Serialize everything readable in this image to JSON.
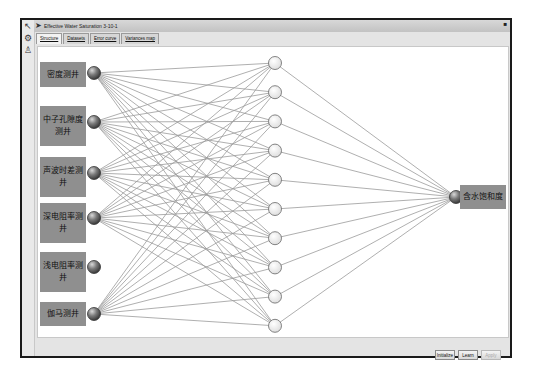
{
  "window": {
    "title": "Effective Water Saturation 3-10-1",
    "close_glyph": "■"
  },
  "sidebar_icons": [
    {
      "name": "pointer-icon",
      "glyph": "↖"
    },
    {
      "name": "gear-icon",
      "glyph": "⚙"
    },
    {
      "name": "person-icon",
      "glyph": "♙"
    }
  ],
  "tabs": [
    {
      "label": "Structure",
      "active": true
    },
    {
      "label": "Datasets",
      "active": false
    },
    {
      "label": "Error curve",
      "active": false
    },
    {
      "label": "Variances map",
      "active": false
    }
  ],
  "network": {
    "input_layer": [
      {
        "label": "密度测井",
        "connected": true
      },
      {
        "label": "中子孔隙度测井",
        "connected": true
      },
      {
        "label": "声波时差测井",
        "connected": true
      },
      {
        "label": "深电阻率测井",
        "connected": true
      },
      {
        "label": "浅电阻率测井",
        "connected": false
      },
      {
        "label": "伽马测井",
        "connected": true
      }
    ],
    "hidden_layer_count": 10,
    "output_layer": [
      {
        "label": "含水饱和度"
      }
    ],
    "colors": {
      "label_box": "#8f8f8f",
      "line": "#9a9a9a",
      "hidden_node_fill": "#f2f2f2",
      "input_node": "#6e6e6e"
    }
  },
  "buttons": {
    "initialize": "Initialize",
    "learn": "Learn",
    "apply": "Apply"
  }
}
